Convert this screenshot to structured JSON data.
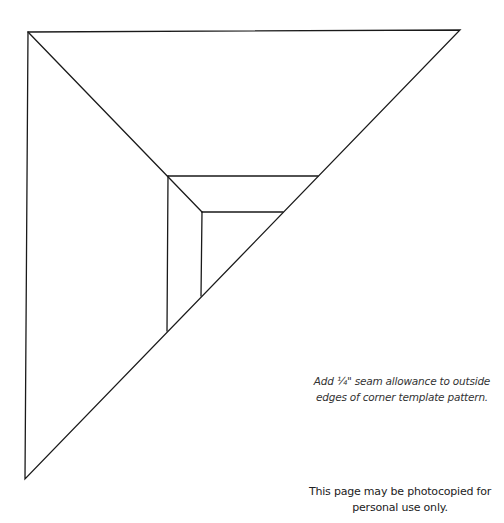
{
  "pattern": {
    "name": "corner template pattern",
    "stroke_color": "#1a1a1a",
    "outer_triangle": [
      [
        28,
        32
      ],
      [
        460,
        30
      ],
      [
        25,
        479
      ]
    ],
    "inner_lines": {
      "diagonal_upper": [
        [
          28,
          32
        ],
        [
          202,
          212
        ]
      ],
      "outer_horizontal": [
        [
          168,
          176
        ],
        [
          318,
          176
        ]
      ],
      "outer_vertical": [
        [
          168,
          176
        ],
        [
          167,
          331
        ]
      ],
      "inner_horizontal": [
        [
          202,
          212
        ],
        [
          283,
          212
        ]
      ],
      "inner_vertical": [
        [
          202,
          212
        ],
        [
          201,
          296
        ]
      ]
    }
  },
  "note": {
    "line1": "Add ¼\" seam allowance to outside",
    "line2": "edges of corner template pattern."
  },
  "footer": {
    "line1": "This page may be photocopied for",
    "line2": "personal use only."
  }
}
